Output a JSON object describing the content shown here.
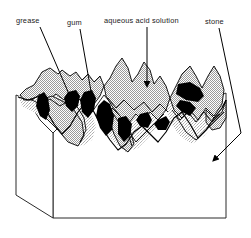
{
  "figure": {
    "type": "schematic-cross-section",
    "background_color": "#ffffff",
    "line_color": "#000000",
    "stipple_fill_color": "#cccccc",
    "solid_fill_color": "#000000",
    "block_face_color": "#ffffff"
  },
  "labels": [
    {
      "id": "grease",
      "text": "grease",
      "x": 16,
      "y": 23,
      "leader": {
        "from_x": 40,
        "from_y": 27,
        "to_x": 72,
        "to_y": 101,
        "style": "plain-line"
      }
    },
    {
      "id": "gum",
      "text": "gum",
      "x": 67,
      "y": 25,
      "leader": {
        "from_x": 80,
        "from_y": 29,
        "to_x": 92,
        "to_y": 97,
        "style": "plain-line"
      }
    },
    {
      "id": "aqueous-acid-solution",
      "text": "aqueous acid solution",
      "x": 104,
      "y": 23,
      "leader": {
        "from_x": 147,
        "from_y": 27,
        "to_x": 147,
        "to_y": 88,
        "style": "arrow"
      }
    },
    {
      "id": "stone",
      "text": "stone",
      "x": 205,
      "y": 24,
      "leader": {
        "from_x": 219,
        "from_y": 28,
        "mid_x": 241,
        "mid_y": 133,
        "to_x": 212,
        "to_y": 162,
        "style": "arrow-bent"
      }
    }
  ],
  "legend_meaning": {
    "stipple": "grease / aqueous acid solution films",
    "solid_black": "gum deposits",
    "outline": "stone substrate"
  }
}
